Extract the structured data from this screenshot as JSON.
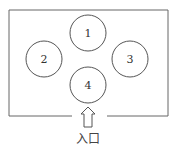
{
  "diagram": {
    "type": "floor-plan",
    "room": {
      "x": 9,
      "y": 10,
      "width": 159,
      "height": 106,
      "gap_start": 72,
      "gap_end": 107
    },
    "circles": [
      {
        "id": "1",
        "label": "1",
        "cx": 88,
        "cy": 33,
        "r": 18
      },
      {
        "id": "2",
        "label": "2",
        "cx": 44,
        "cy": 59,
        "r": 18
      },
      {
        "id": "3",
        "label": "3",
        "cx": 130,
        "cy": 59,
        "r": 18
      },
      {
        "id": "4",
        "label": "4",
        "cx": 88,
        "cy": 85,
        "r": 18
      }
    ],
    "entrance": {
      "label": "入口",
      "icon": "up-arrow-icon"
    },
    "colors": {
      "stroke": "#555555",
      "text": "#333333",
      "background": "#ffffff"
    }
  }
}
